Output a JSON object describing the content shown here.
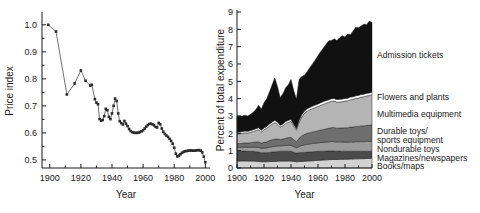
{
  "figure": {
    "panels": [
      "price-index-scatter",
      "expenditure-stacked-area"
    ]
  },
  "chart_data": [
    {
      "type": "scatter",
      "title": "",
      "xlabel": "Year",
      "ylabel": "Price index",
      "xlim": [
        1895,
        2003
      ],
      "ylim": [
        0.47,
        1.04
      ],
      "xticks": [
        1900,
        1920,
        1940,
        1960,
        1980,
        2000
      ],
      "xticklabels": [
        "1900",
        "1920",
        "1940",
        "1960",
        "1980",
        "2000"
      ],
      "yticks": [
        0.5,
        0.6,
        0.7,
        0.8,
        0.9,
        1.0
      ],
      "yticklabels": [
        "0.5",
        "0.6",
        "0.7",
        "0.8",
        "0.9",
        "1.0"
      ],
      "grid": false,
      "legend": "none",
      "marker": "square",
      "connected": true,
      "series": [
        {
          "name": "Price index",
          "x": [
            1899,
            1904,
            1911,
            1916,
            1920,
            1923,
            1926,
            1927,
            1929,
            1930,
            1931,
            1932,
            1933,
            1934,
            1935,
            1936,
            1937,
            1938,
            1939,
            1940,
            1941,
            1942,
            1943,
            1944,
            1945,
            1946,
            1947,
            1948,
            1949,
            1950,
            1951,
            1952,
            1953,
            1954,
            1955,
            1956,
            1957,
            1958,
            1959,
            1960,
            1961,
            1962,
            1963,
            1964,
            1965,
            1966,
            1967,
            1968,
            1969,
            1970,
            1971,
            1972,
            1973,
            1974,
            1975,
            1976,
            1977,
            1978,
            1979,
            1980,
            1981,
            1982,
            1983,
            1984,
            1985,
            1986,
            1987,
            1988,
            1989,
            1990,
            1991,
            1992,
            1993,
            1994,
            1995,
            1996,
            1997,
            1998,
            1999,
            2000
          ],
          "y": [
            1.0,
            0.975,
            0.742,
            0.783,
            0.831,
            0.793,
            0.775,
            0.778,
            0.725,
            0.712,
            0.706,
            0.651,
            0.645,
            0.648,
            0.662,
            0.689,
            0.684,
            0.659,
            0.651,
            0.672,
            0.7,
            0.727,
            0.718,
            0.672,
            0.643,
            0.636,
            0.631,
            0.644,
            0.634,
            0.625,
            0.614,
            0.607,
            0.603,
            0.601,
            0.6,
            0.6,
            0.601,
            0.603,
            0.606,
            0.61,
            0.616,
            0.623,
            0.629,
            0.633,
            0.634,
            0.632,
            0.628,
            0.622,
            0.62,
            0.637,
            0.632,
            0.616,
            0.604,
            0.596,
            0.59,
            0.585,
            0.578,
            0.57,
            0.56,
            0.545,
            0.523,
            0.513,
            0.516,
            0.521,
            0.526,
            0.53,
            0.532,
            0.533,
            0.534,
            0.535,
            0.535,
            0.534,
            0.534,
            0.535,
            0.536,
            0.536,
            0.534,
            0.528,
            0.512,
            0.491
          ]
        }
      ]
    },
    {
      "type": "area",
      "title": "",
      "xlabel": "Year",
      "ylabel": "Percent of total expenditure",
      "xlim": [
        1900,
        2000
      ],
      "ylim": [
        0,
        9
      ],
      "xticks": [
        1900,
        1920,
        1940,
        1960,
        1980,
        2000
      ],
      "xticklabels": [
        "1900",
        "1920",
        "1940",
        "1960",
        "1980",
        "2000"
      ],
      "yticks": [
        0,
        1,
        2,
        3,
        4,
        5,
        6,
        7,
        8,
        9
      ],
      "yticklabels": [
        "0",
        "1",
        "2",
        "3",
        "4",
        "5",
        "6",
        "7",
        "8",
        "9"
      ],
      "grid": false,
      "stacked": true,
      "legend": "right-labels",
      "x": [
        1900,
        1902,
        1904,
        1906,
        1908,
        1910,
        1912,
        1914,
        1916,
        1918,
        1920,
        1922,
        1924,
        1926,
        1928,
        1930,
        1932,
        1934,
        1936,
        1938,
        1940,
        1942,
        1944,
        1946,
        1948,
        1950,
        1952,
        1954,
        1956,
        1958,
        1960,
        1962,
        1964,
        1966,
        1968,
        1970,
        1972,
        1974,
        1976,
        1978,
        1980,
        1982,
        1984,
        1986,
        1988,
        1990,
        1992,
        1994,
        1996,
        1998,
        2000
      ],
      "series": [
        {
          "name": "Books/maps",
          "color": "#d2d2d2",
          "values": [
            0.4,
            0.4,
            0.41,
            0.41,
            0.4,
            0.4,
            0.4,
            0.39,
            0.38,
            0.36,
            0.36,
            0.36,
            0.37,
            0.38,
            0.38,
            0.39,
            0.4,
            0.4,
            0.4,
            0.4,
            0.4,
            0.38,
            0.36,
            0.37,
            0.38,
            0.39,
            0.4,
            0.41,
            0.42,
            0.43,
            0.44,
            0.45,
            0.46,
            0.47,
            0.48,
            0.49,
            0.49,
            0.49,
            0.5,
            0.5,
            0.51,
            0.51,
            0.52,
            0.52,
            0.53,
            0.53,
            0.54,
            0.54,
            0.55,
            0.55,
            0.56
          ]
        },
        {
          "name": "Magazines/newspapers",
          "color": "#4a4a4a",
          "values": [
            0.57,
            0.57,
            0.57,
            0.57,
            0.56,
            0.56,
            0.56,
            0.55,
            0.54,
            0.52,
            0.52,
            0.52,
            0.53,
            0.54,
            0.55,
            0.56,
            0.57,
            0.57,
            0.57,
            0.57,
            0.56,
            0.53,
            0.5,
            0.51,
            0.52,
            0.52,
            0.52,
            0.52,
            0.52,
            0.52,
            0.52,
            0.52,
            0.51,
            0.51,
            0.5,
            0.5,
            0.49,
            0.48,
            0.48,
            0.47,
            0.46,
            0.45,
            0.45,
            0.44,
            0.44,
            0.43,
            0.43,
            0.42,
            0.42,
            0.41,
            0.41
          ]
        },
        {
          "name": "Nondurable toys",
          "color": "#9a9a9a",
          "values": [
            0.22,
            0.22,
            0.22,
            0.23,
            0.23,
            0.24,
            0.25,
            0.26,
            0.27,
            0.26,
            0.27,
            0.28,
            0.3,
            0.31,
            0.32,
            0.32,
            0.31,
            0.32,
            0.33,
            0.34,
            0.35,
            0.33,
            0.31,
            0.36,
            0.4,
            0.43,
            0.45,
            0.46,
            0.47,
            0.48,
            0.49,
            0.5,
            0.51,
            0.52,
            0.53,
            0.54,
            0.54,
            0.53,
            0.53,
            0.53,
            0.53,
            0.53,
            0.54,
            0.54,
            0.55,
            0.55,
            0.56,
            0.56,
            0.57,
            0.57,
            0.58
          ]
        },
        {
          "name": "Durable toys/ sports equipment",
          "color": "#6e6e6e",
          "values": [
            0.22,
            0.22,
            0.23,
            0.24,
            0.25,
            0.26,
            0.28,
            0.3,
            0.32,
            0.3,
            0.33,
            0.35,
            0.38,
            0.4,
            0.42,
            0.4,
            0.36,
            0.38,
            0.42,
            0.44,
            0.46,
            0.4,
            0.35,
            0.48,
            0.55,
            0.6,
            0.63,
            0.65,
            0.67,
            0.68,
            0.7,
            0.72,
            0.74,
            0.76,
            0.78,
            0.8,
            0.81,
            0.8,
            0.8,
            0.81,
            0.82,
            0.83,
            0.85,
            0.86,
            0.88,
            0.89,
            0.9,
            0.91,
            0.92,
            0.93,
            0.94
          ]
        },
        {
          "name": "Multimedia equipment",
          "color": "#b4b4b4",
          "values": [
            0.55,
            0.56,
            0.57,
            0.58,
            0.58,
            0.6,
            0.62,
            0.66,
            0.7,
            0.64,
            0.72,
            0.78,
            0.84,
            0.9,
            0.95,
            0.86,
            0.72,
            0.76,
            0.84,
            0.88,
            0.92,
            0.78,
            0.66,
            0.92,
            1.1,
            1.22,
            1.28,
            1.32,
            1.35,
            1.38,
            1.4,
            1.43,
            1.46,
            1.48,
            1.5,
            1.52,
            1.53,
            1.5,
            1.5,
            1.52,
            1.54,
            1.56,
            1.58,
            1.6,
            1.62,
            1.64,
            1.66,
            1.68,
            1.7,
            1.72,
            1.74
          ]
        },
        {
          "name": "Flowers and plants",
          "color": "#ffffff",
          "values": [
            0.1,
            0.1,
            0.1,
            0.1,
            0.1,
            0.1,
            0.1,
            0.11,
            0.11,
            0.1,
            0.11,
            0.11,
            0.12,
            0.12,
            0.13,
            0.12,
            0.11,
            0.11,
            0.12,
            0.12,
            0.12,
            0.11,
            0.1,
            0.12,
            0.13,
            0.14,
            0.14,
            0.14,
            0.14,
            0.14,
            0.14,
            0.15,
            0.15,
            0.15,
            0.15,
            0.15,
            0.15,
            0.15,
            0.15,
            0.15,
            0.15,
            0.15,
            0.15,
            0.15,
            0.15,
            0.15,
            0.15,
            0.15,
            0.15,
            0.15,
            0.15
          ]
        },
        {
          "name": "Admission tickets",
          "color": "#111111",
          "values": [
            0.94,
            0.93,
            0.9,
            0.92,
            0.88,
            0.94,
            1.0,
            1.1,
            1.3,
            1.22,
            1.45,
            1.6,
            1.85,
            2.15,
            2.45,
            2.05,
            1.6,
            1.75,
            1.95,
            2.05,
            2.3,
            1.95,
            1.7,
            2.35,
            2.2,
            2.05,
            2.15,
            2.3,
            2.45,
            2.6,
            2.8,
            2.95,
            3.1,
            3.25,
            3.4,
            3.35,
            3.45,
            3.4,
            3.55,
            3.65,
            3.55,
            3.7,
            3.6,
            3.8,
            3.95,
            3.9,
            3.95,
            4.05,
            3.95,
            4.15,
            4.02
          ]
        }
      ],
      "callouts": [
        {
          "label": "Admission tickets"
        },
        {
          "label": "Flowers and plants"
        },
        {
          "label": "Multimedia equipment"
        },
        {
          "label": "Durable toys/"
        },
        {
          "label": "sports equipment"
        },
        {
          "label": "Nondurable toys"
        },
        {
          "label": "Magazines/newspapers"
        },
        {
          "label": "Books/maps"
        }
      ]
    }
  ]
}
